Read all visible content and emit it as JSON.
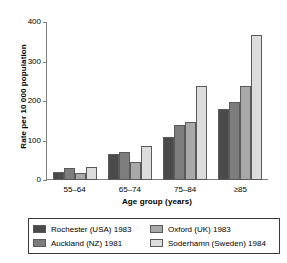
{
  "chart_data": {
    "type": "bar",
    "title": "",
    "xlabel": "Age group (years)",
    "ylabel": "Rate per 10 000 population",
    "categories": [
      "55–64",
      "65–74",
      "75–84",
      "≥85"
    ],
    "series": [
      {
        "name": "Rochester (USA) 1983",
        "values": [
          20,
          67,
          110,
          180
        ],
        "color": "#4a4a4a"
      },
      {
        "name": "Auckland (NZ) 1981",
        "values": [
          30,
          70,
          140,
          198
        ],
        "color": "#7d7d7d"
      },
      {
        "name": "Oxford (UK) 1983",
        "values": [
          19,
          46,
          147,
          237
        ],
        "color": "#a8a8a8"
      },
      {
        "name": "Soderhamn (Sweden) 1984",
        "values": [
          32,
          85,
          238,
          368
        ],
        "color": "#dcdcdc"
      }
    ],
    "ylim": [
      0,
      400
    ],
    "yticks": [
      0,
      100,
      200,
      300,
      400
    ],
    "ytick_labels": [
      "0",
      "100",
      "200",
      "300",
      "400"
    ],
    "grid": false,
    "legend_position": "below-plot",
    "legend_order": [
      [
        "Rochester (USA) 1983",
        "Oxford (UK) 1983"
      ],
      [
        "Auckland (NZ) 1981",
        "Soderhamn (Sweden) 1984"
      ]
    ],
    "bar_outline_color": "#5a5a5a",
    "axis_color": "#808080"
  }
}
